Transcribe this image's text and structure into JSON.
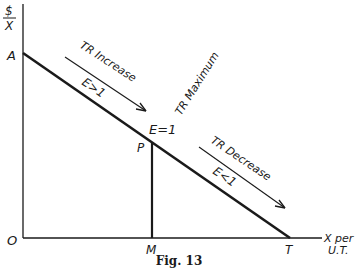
{
  "figure": {
    "caption": "Fig. 13",
    "y_axis_label_top": "$",
    "y_axis_label_bottom": "X",
    "x_axis_label_line1": "X per",
    "x_axis_label_line2": "U.T.",
    "points": {
      "origin": "O",
      "intercept_y": "A",
      "midpoint": "P",
      "midpoint_x": "M",
      "intercept_x": "T"
    },
    "annotations": {
      "tr_increase": "TR Increase",
      "elastic": "E>1",
      "tr_maximum": "TR Maximum",
      "unit_elastic": "E=1",
      "tr_decrease": "TR Decrease",
      "inelastic": "E<1"
    },
    "colors": {
      "ink": "#1a1a1a",
      "background": "#ffffff"
    }
  }
}
